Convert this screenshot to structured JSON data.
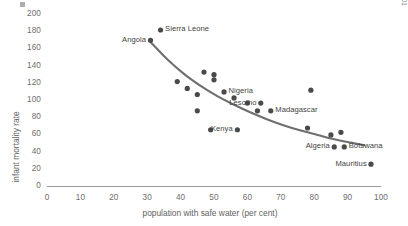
{
  "chart_data": {
    "type": "scatter",
    "title": "",
    "xlabel": "population with safe water (per cent)",
    "ylabel": "infant mortality rate",
    "xlim": [
      0,
      100
    ],
    "ylim": [
      0,
      200
    ],
    "xticks": [
      0,
      10,
      20,
      30,
      40,
      50,
      60,
      70,
      80,
      90,
      100
    ],
    "yticks": [
      0,
      20,
      40,
      60,
      80,
      100,
      120,
      140,
      160,
      180,
      200
    ],
    "grid": false,
    "legend": null,
    "source_note": "Source: UNDP Human Development Report 2001",
    "marker_color": "#4a4a4a",
    "trendline_color": "#6f6f6f",
    "axis_color": "#9a9a9a",
    "points": [
      {
        "name": "Sierra Leone",
        "x": 34,
        "y": 182,
        "label": "Sierra Leone",
        "label_pos": "right"
      },
      {
        "name": "Angola",
        "x": 31,
        "y": 170,
        "label": "Angola",
        "label_pos": "left"
      },
      {
        "name": "",
        "x": 39,
        "y": 122,
        "label": "",
        "label_pos": "none"
      },
      {
        "name": "",
        "x": 42,
        "y": 114,
        "label": "",
        "label_pos": "none"
      },
      {
        "name": "",
        "x": 45,
        "y": 107,
        "label": "",
        "label_pos": "none"
      },
      {
        "name": "",
        "x": 47,
        "y": 133,
        "label": "",
        "label_pos": "none"
      },
      {
        "name": "",
        "x": 50,
        "y": 130,
        "label": "",
        "label_pos": "none"
      },
      {
        "name": "",
        "x": 50,
        "y": 124,
        "label": "",
        "label_pos": "none"
      },
      {
        "name": "Nigeria",
        "x": 53,
        "y": 110,
        "label": "Nigeria",
        "label_pos": "right"
      },
      {
        "name": "",
        "x": 56,
        "y": 103,
        "label": "",
        "label_pos": "none"
      },
      {
        "name": "",
        "x": 45,
        "y": 88,
        "label": "",
        "label_pos": "none"
      },
      {
        "name": "",
        "x": 49,
        "y": 66,
        "label": "",
        "label_pos": "none"
      },
      {
        "name": "Kenya",
        "x": 57,
        "y": 66,
        "label": "Kenya",
        "label_pos": "left"
      },
      {
        "name": "",
        "x": 60,
        "y": 97,
        "label": "",
        "label_pos": "none"
      },
      {
        "name": "Lesotho",
        "x": 64,
        "y": 97,
        "label": "Lesotho",
        "label_pos": "left"
      },
      {
        "name": "",
        "x": 63,
        "y": 88,
        "label": "",
        "label_pos": "none"
      },
      {
        "name": "Madagascar",
        "x": 67,
        "y": 88,
        "label": "Madagascar",
        "label_pos": "right"
      },
      {
        "name": "",
        "x": 79,
        "y": 112,
        "label": "",
        "label_pos": "none"
      },
      {
        "name": "",
        "x": 78,
        "y": 68,
        "label": "",
        "label_pos": "none"
      },
      {
        "name": "",
        "x": 85,
        "y": 60,
        "label": "",
        "label_pos": "none"
      },
      {
        "name": "",
        "x": 88,
        "y": 63,
        "label": "",
        "label_pos": "none"
      },
      {
        "name": "Algeria",
        "x": 86,
        "y": 46,
        "label": "Algeria",
        "label_pos": "left"
      },
      {
        "name": "Botswana",
        "x": 89,
        "y": 46,
        "label": "Botswana",
        "label_pos": "right"
      },
      {
        "name": "Mauritius",
        "x": 97,
        "y": 26,
        "label": "Mauritius",
        "label_pos": "left"
      }
    ],
    "trendline": {
      "description": "smooth decreasing curve fitted through the data",
      "points": [
        {
          "x": 31,
          "y": 168
        },
        {
          "x": 36,
          "y": 148
        },
        {
          "x": 41,
          "y": 131
        },
        {
          "x": 46,
          "y": 117
        },
        {
          "x": 51,
          "y": 105
        },
        {
          "x": 56,
          "y": 95
        },
        {
          "x": 61,
          "y": 86
        },
        {
          "x": 66,
          "y": 78
        },
        {
          "x": 71,
          "y": 71
        },
        {
          "x": 76,
          "y": 65
        },
        {
          "x": 81,
          "y": 60
        },
        {
          "x": 86,
          "y": 55
        },
        {
          "x": 91,
          "y": 51
        },
        {
          "x": 95,
          "y": 48
        }
      ]
    }
  }
}
